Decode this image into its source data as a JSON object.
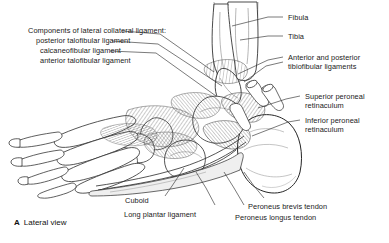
{
  "figure": {
    "caption_marker": "A",
    "caption_text": "Lateral view",
    "caption_full": "A Lateral view",
    "view": "Lateral view of the foot and ankle"
  },
  "colors": {
    "background": "#ffffff",
    "ink": "#1a1a1a",
    "leader": "#333333",
    "bone_outline": "#2a2a2a",
    "bone_fill": "#ffffff",
    "hatch": "#3a3a3a",
    "shaft_light": "#b9b9b9"
  },
  "labels": {
    "left_block": {
      "heading": "Components of lateral collateral ligament:",
      "items": [
        "posterior talofibular ligament",
        "calcaneofibular ligament",
        "anterior talofibular ligament"
      ]
    },
    "right": [
      {
        "id": "fibula",
        "text": "Fibula"
      },
      {
        "id": "tibia",
        "text": "Tibia"
      },
      {
        "id": "tibiofibular-ligaments",
        "line1": "Anterior and posterior",
        "line2": "tibiofibular ligaments"
      },
      {
        "id": "superior-peroneal-retinaculum",
        "line1": "Superior peroneal",
        "line2": "retinaculum"
      },
      {
        "id": "inferior-peroneal-retinaculum",
        "line1": "Inferior peroneal",
        "line2": "retinaculum"
      }
    ],
    "bottom": [
      {
        "id": "cuboid",
        "text": "Cuboid"
      },
      {
        "id": "long-plantar-ligament",
        "text": "Long plantar ligament"
      },
      {
        "id": "peroneus-brevis-tendon",
        "text": "Peroneus brevis tendon"
      },
      {
        "id": "peroneus-longus-tendon",
        "text": "Peroneus longus tendon"
      }
    ]
  }
}
